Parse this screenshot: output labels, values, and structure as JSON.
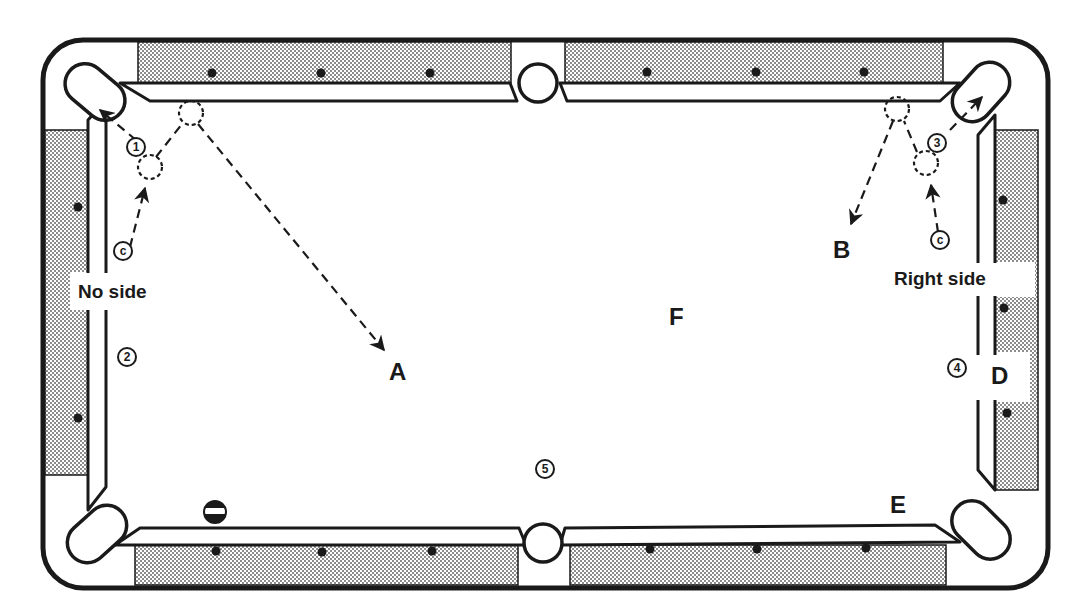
{
  "diagram": {
    "type": "pool-table-shot-diagram",
    "colors": {
      "ink": "#1a1a1a",
      "rail_fill": "#bdbdbd",
      "cloth": "#ffffff"
    },
    "table": {
      "pockets": [
        "top-left-corner",
        "top-side",
        "top-right-corner",
        "bottom-left-corner",
        "bottom-side",
        "bottom-right-corner"
      ],
      "diamonds_per_long_rail_section": 3,
      "diamonds_per_short_rail": 3
    },
    "labels": {
      "A": "A",
      "B": "B",
      "D": "D",
      "E": "E",
      "F": "F",
      "no_side": "No side",
      "right_side": "Right side"
    },
    "balls": {
      "ball_1": "1",
      "ball_2": "2",
      "ball_3": "3",
      "ball_4": "4",
      "ball_5": "5",
      "cue_left": "c",
      "cue_right": "c"
    },
    "shots": [
      {
        "name": "no-side-shot",
        "cue": "cue_left",
        "object_ball": "1",
        "pocket": "top-left-corner",
        "cue_path_to": "A",
        "english": "No side"
      },
      {
        "name": "right-side-shot",
        "cue": "cue_right",
        "object_ball": "3",
        "pocket": "top-right-corner",
        "cue_path_to": "B",
        "english": "Right side"
      }
    ],
    "striped_ball": "striped ball near bottom-left rail"
  }
}
